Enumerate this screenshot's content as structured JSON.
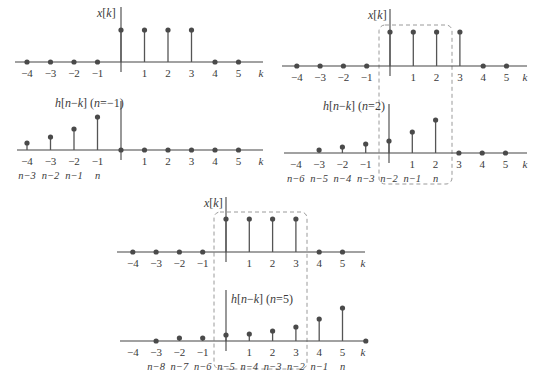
{
  "figure": {
    "axis_var": "k",
    "k_ticks": [
      -4,
      -3,
      -2,
      -1,
      0,
      1,
      2,
      3,
      4,
      5
    ],
    "colors": {
      "stem": "#555555",
      "dot": "#4a4a4a",
      "axis": "#444444",
      "dashed_box": "#9a9a9a",
      "text": "#3a3a3a"
    }
  },
  "panels": [
    {
      "id": "x-top-left",
      "label_main": "x[",
      "label_var": "k",
      "label_end": "]",
      "label_extra": "",
      "origin_x": 121,
      "axis_y": 62,
      "spacing": 23.5,
      "axis_x0": 15,
      "axis_x1": 263,
      "vaxis_top": 7,
      "label_x": 97,
      "label_y": 17,
      "label_anchor": "end-left",
      "stems": [
        [
          -4,
          0
        ],
        [
          -3,
          0
        ],
        [
          -2,
          0
        ],
        [
          -1,
          0
        ],
        [
          0,
          32
        ],
        [
          1,
          32
        ],
        [
          2,
          32
        ],
        [
          3,
          32
        ],
        [
          4,
          0
        ],
        [
          5,
          0
        ]
      ],
      "tick_labels": [
        "-4",
        "-3",
        "-2",
        "-1",
        "",
        "1",
        "2",
        "3",
        "4",
        "5"
      ],
      "sub_labels": []
    },
    {
      "id": "h-n-minus1",
      "label_main": "h[n−",
      "label_var": "k",
      "label_end": "] (n=−1)",
      "label_extra": "",
      "origin_x": 121,
      "axis_y": 150,
      "spacing": 23.5,
      "axis_x0": 17,
      "axis_x1": 263,
      "vaxis_top": 101,
      "label_x": 55,
      "label_y": 107,
      "stems": [
        [
          -4,
          7
        ],
        [
          -3,
          13
        ],
        [
          -2,
          21
        ],
        [
          -1,
          33
        ],
        [
          0,
          0
        ],
        [
          1,
          0
        ],
        [
          2,
          0
        ],
        [
          3,
          0
        ],
        [
          4,
          0
        ],
        [
          5,
          0
        ]
      ],
      "tick_labels": [
        "-4",
        "-3",
        "-2",
        "-1",
        "",
        "1",
        "2",
        "3",
        "4",
        "5"
      ],
      "sub_labels": [
        "n−3",
        "n−2",
        "n−1",
        "n",
        "",
        "",
        "",
        "",
        "",
        ""
      ]
    },
    {
      "id": "x-top-right",
      "label_main": "x[",
      "label_var": "k",
      "label_end": "]",
      "label_extra": "",
      "origin_x": 390,
      "axis_y": 66,
      "spacing": 23.3,
      "axis_x0": 282,
      "axis_x1": 527,
      "vaxis_top": 9,
      "label_x": 368,
      "label_y": 19,
      "stems": [
        [
          -4,
          0
        ],
        [
          -3,
          0
        ],
        [
          -2,
          0
        ],
        [
          -1,
          0
        ],
        [
          0,
          34
        ],
        [
          1,
          34
        ],
        [
          2,
          34
        ],
        [
          3,
          34
        ],
        [
          4,
          0
        ],
        [
          5,
          0
        ]
      ],
      "tick_labels": [
        "-4",
        "-3",
        "-2",
        "-1",
        "",
        "1",
        "2",
        "3",
        "4",
        "5"
      ],
      "sub_labels": []
    },
    {
      "id": "h-n-2",
      "label_main": "h[n−",
      "label_var": "k",
      "label_end": "] (n=2)",
      "label_extra": "",
      "origin_x": 389,
      "axis_y": 153,
      "spacing": 23.3,
      "axis_x0": 284,
      "axis_x1": 527,
      "vaxis_top": 104,
      "label_x": 323,
      "label_y": 110,
      "stems": [
        [
          -3,
          3
        ],
        [
          -2,
          6
        ],
        [
          -1,
          9
        ],
        [
          0,
          12
        ],
        [
          1,
          21
        ],
        [
          2,
          33
        ],
        [
          3,
          0
        ],
        [
          4,
          0
        ],
        [
          5,
          0
        ]
      ],
      "tick_labels": [
        "-4",
        "-3",
        "-2",
        "-1",
        "",
        "1",
        "2",
        "3",
        "4",
        "5"
      ],
      "sub_labels": [
        "n−6",
        "n−5",
        "n−4",
        "n−3",
        "n−2",
        "n−1",
        "n",
        "",
        "",
        ""
      ]
    },
    {
      "id": "x-bottom",
      "label_main": "x[",
      "label_var": "k",
      "label_end": "]",
      "label_extra": "",
      "origin_x": 226,
      "axis_y": 252,
      "spacing": 23.3,
      "axis_x0": 117,
      "axis_x1": 365,
      "vaxis_top": 197,
      "label_x": 204,
      "label_y": 207,
      "stems": [
        [
          -4,
          0
        ],
        [
          -3,
          0
        ],
        [
          -2,
          0
        ],
        [
          -1,
          0
        ],
        [
          0,
          33
        ],
        [
          1,
          33
        ],
        [
          2,
          33
        ],
        [
          3,
          33
        ],
        [
          4,
          0
        ],
        [
          5,
          0
        ]
      ],
      "tick_labels": [
        "-4",
        "-3",
        "-2",
        "-1",
        "",
        "1",
        "2",
        "3",
        "4",
        "5"
      ],
      "sub_labels": []
    },
    {
      "id": "h-n-5",
      "label_main": "h[n−",
      "label_var": "k",
      "label_end": "] (n=5)",
      "label_extra": "",
      "origin_x": 226,
      "axis_y": 341,
      "spacing": 23.3,
      "axis_x0": 120,
      "axis_x1": 365,
      "vaxis_top": 290,
      "label_x": 231,
      "label_y": 303,
      "stems": [
        [
          -3,
          0
        ],
        [
          -2,
          3
        ],
        [
          -1,
          3
        ],
        [
          0,
          6
        ],
        [
          1,
          7
        ],
        [
          2,
          10
        ],
        [
          3,
          14
        ],
        [
          4,
          22
        ],
        [
          5,
          33
        ],
        [
          6,
          0
        ]
      ],
      "tick_labels": [
        "-4",
        "-3",
        "-2",
        "-1",
        "",
        "1",
        "2",
        "3",
        "4",
        "5"
      ],
      "sub_labels": [
        "",
        "n−8",
        "n−7",
        "n−6",
        "n−5",
        "n−4",
        "n−3",
        "n−2",
        "n−1",
        "n"
      ]
    }
  ],
  "dashed_boxes": [
    {
      "id": "overlap-n2",
      "x": 379,
      "y": 25,
      "w": 73,
      "h": 159,
      "r": 6
    },
    {
      "id": "overlap-n5",
      "x": 214,
      "y": 212,
      "w": 93,
      "h": 157,
      "r": 6
    }
  ],
  "text": {
    "x_label": "x[k]",
    "h_label_n_minus1": "h[n−k] (n=−1)",
    "h_label_n2": "h[n−k] (n=2)",
    "h_label_n5": "h[n−k] (n=5)",
    "k_axis_label": "k"
  }
}
